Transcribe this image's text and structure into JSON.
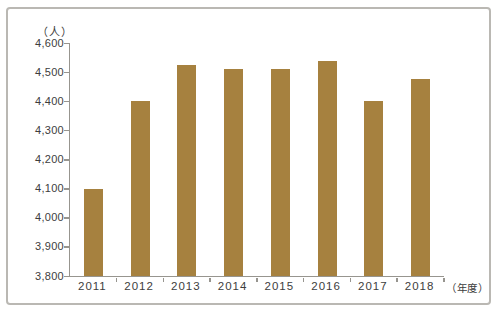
{
  "chart_data": {
    "type": "bar",
    "title": "",
    "unit_y": "（人）",
    "unit_x": "（年度）",
    "categories": [
      "2011",
      "2012",
      "2013",
      "2014",
      "2015",
      "2016",
      "2017",
      "2018"
    ],
    "values": [
      4100,
      4400,
      4525,
      4510,
      4510,
      4540,
      4400,
      4475
    ],
    "ylim": [
      3800,
      4600
    ],
    "ytick_step": 100,
    "ytick_labels_top_to_bottom": [
      "4,600",
      "4,500",
      "4,400",
      "4,300",
      "4,200",
      "4,100",
      "4,000",
      "3,900",
      "3,800"
    ],
    "grid": false,
    "legend": null,
    "bar_color": "#a6813f",
    "axis_color": "#97958f",
    "text_color": "#3d3d3d",
    "panel_border_color": "#bab8b3"
  }
}
